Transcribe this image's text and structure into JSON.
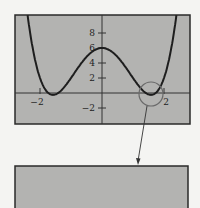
{
  "chart_data": {
    "type": "line",
    "title": "",
    "xlabel": "",
    "ylabel": "",
    "xlim": [
      -2.8,
      2.8
    ],
    "ylim": [
      -4,
      10.4
    ],
    "x_ticks": [
      -2,
      2
    ],
    "x_tick_labels": [
      "−2",
      "2"
    ],
    "y_ticks": [
      8,
      6,
      4,
      2,
      -2
    ],
    "y_tick_labels": [
      "8",
      "6",
      "4",
      "2",
      "−2"
    ],
    "grid": false,
    "legend": null,
    "series": [
      {
        "name": "f(x)",
        "description": "quartic curve with local maximum at (0, 6) and two minima just below the x-axis near x = ±1.6",
        "points": [
          {
            "x": -2.4,
            "y": 10.4
          },
          {
            "x": -2.0,
            "y": 2.0
          },
          {
            "x": -1.58,
            "y": -0.25
          },
          {
            "x": -1.0,
            "y": 2.0
          },
          {
            "x": 0,
            "y": 6
          },
          {
            "x": 1.0,
            "y": 2.0
          },
          {
            "x": 1.58,
            "y": -0.25
          },
          {
            "x": 2.0,
            "y": 2.0
          },
          {
            "x": 2.4,
            "y": 10.4
          }
        ]
      }
    ],
    "annotations": [
      {
        "type": "circle",
        "center": {
          "x": 1.58,
          "y": -0.25
        },
        "note": "circled region around the right minimum"
      },
      {
        "type": "arrow",
        "from": "circled region",
        "to": "zoomed viewing window below"
      }
    ],
    "zoom_window": {
      "content": "blank gray viewing window"
    }
  },
  "colors": {
    "panel_fill": "#b3b3b1",
    "frame": "#2a2a2a",
    "curve": "#1e1e1e",
    "axis": "#333333",
    "circle": "#6a6a6a",
    "background": "#f4f4f2"
  }
}
